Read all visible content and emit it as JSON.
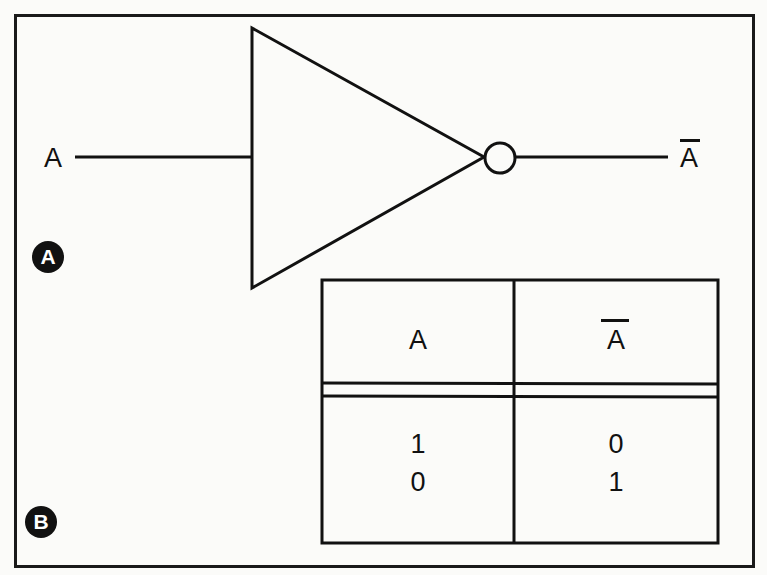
{
  "figure": {
    "gate": {
      "type": "NOT",
      "input_label": "A",
      "output_label": "A",
      "output_overbar": true
    },
    "panel_labels": [
      {
        "id": "A",
        "label": "A"
      },
      {
        "id": "B",
        "label": "B"
      }
    ],
    "truth_table": {
      "headers": [
        {
          "label": "A",
          "overbar": false
        },
        {
          "label": "A",
          "overbar": true
        }
      ],
      "rows": [
        [
          "1",
          "0"
        ],
        [
          "0",
          "1"
        ]
      ]
    },
    "colors": {
      "line": "#111111",
      "background": "#fbfbf9",
      "badge_fill": "#111111",
      "badge_text": "#ffffff"
    }
  }
}
